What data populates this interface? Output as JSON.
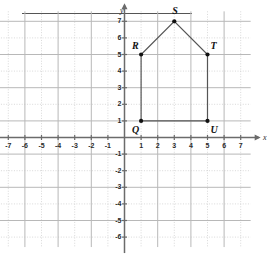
{
  "figure": {
    "title": "",
    "top_rule": true,
    "axis_labels": {
      "x": "x",
      "y": "y"
    }
  },
  "chart_data": {
    "type": "scatter",
    "title": "",
    "xlabel": "x",
    "ylabel": "y",
    "xlim": [
      -7.6,
      7.6
    ],
    "ylim": [
      -6.6,
      7.6
    ],
    "grid": true,
    "grid_spacing": 1,
    "legend": "none",
    "x_ticks": [
      -7,
      -6,
      -5,
      -4,
      -3,
      -2,
      -1,
      1,
      2,
      3,
      4,
      5,
      6,
      7
    ],
    "y_ticks": [
      7,
      6,
      5,
      4,
      3,
      2,
      1,
      -1,
      -2,
      -3,
      -4,
      -5,
      -6
    ],
    "x_tick_labels": [
      "-7",
      "-6",
      "-5",
      "-4",
      "-3",
      "-2",
      "-1",
      "1",
      "2",
      "3",
      "4",
      "5",
      "6",
      "7"
    ],
    "y_tick_labels": [
      "7",
      "6",
      "5",
      "4",
      "3",
      "2",
      "1",
      "-1",
      "-2",
      "-3",
      "-4",
      "-5",
      "-6"
    ],
    "points": [
      {
        "label": "Q",
        "x": 1,
        "y": 1,
        "label_pos": "below-left"
      },
      {
        "label": "R",
        "x": 1,
        "y": 5,
        "label_pos": "above-left"
      },
      {
        "label": "S",
        "x": 3,
        "y": 7,
        "label_pos": "above"
      },
      {
        "label": "T",
        "x": 5,
        "y": 5,
        "label_pos": "above-right"
      },
      {
        "label": "U",
        "x": 5,
        "y": 1,
        "label_pos": "below-right"
      }
    ],
    "polygon": {
      "name": "QRSTU",
      "closed": true,
      "vertices": [
        [
          1,
          1
        ],
        [
          1,
          5
        ],
        [
          3,
          7
        ],
        [
          5,
          5
        ],
        [
          5,
          1
        ]
      ],
      "edge_color": "#555555",
      "fill": "none"
    },
    "colors": {
      "axis": "#6b6b6b",
      "major_grid": "#b8b8b8",
      "minor_grid": "#cfcfcf",
      "point": "#111111",
      "text": "#2b2b2b"
    }
  }
}
